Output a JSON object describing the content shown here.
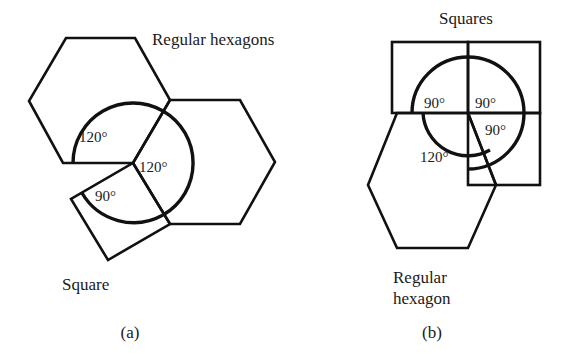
{
  "figure": {
    "background_color": "#ffffff",
    "stroke_color": "#111111",
    "text_color": "#1a1a1a",
    "panels": [
      {
        "id": "a",
        "label": "(a)",
        "labels": {
          "polygons_top": "Regular hexagons",
          "polygon_bottom": "Square"
        },
        "angles": [
          {
            "id": "hex-upper-left",
            "value": "120°"
          },
          {
            "id": "hex-right",
            "value": "120°"
          },
          {
            "id": "square-lower-left",
            "value": "90°"
          }
        ],
        "angle_sum": "330°",
        "shapes": [
          {
            "name": "regular-hexagon-upper-left",
            "sides": 6
          },
          {
            "name": "regular-hexagon-right",
            "sides": 6
          },
          {
            "name": "square-lower-left",
            "sides": 4
          }
        ]
      },
      {
        "id": "b",
        "label": "(b)",
        "labels": {
          "polygons_top": "Squares",
          "polygon_bottom_line1": "Regular",
          "polygon_bottom_line2": "hexagon"
        },
        "angles": [
          {
            "id": "square-upper-left",
            "value": "90°"
          },
          {
            "id": "square-upper-right",
            "value": "90°"
          },
          {
            "id": "square-lower-right",
            "value": "90°"
          },
          {
            "id": "hexagon-lower-left",
            "value": "120°"
          }
        ],
        "angle_sum": "390°",
        "shapes": [
          {
            "name": "square-upper-left",
            "sides": 4
          },
          {
            "name": "square-upper-right",
            "sides": 4
          },
          {
            "name": "square-lower-right",
            "sides": 4
          },
          {
            "name": "regular-hexagon-lower-left",
            "sides": 6
          }
        ]
      }
    ]
  }
}
